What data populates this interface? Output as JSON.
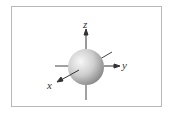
{
  "diagram": {
    "shape": "sphere",
    "axes": [
      {
        "name": "z",
        "label": "z"
      },
      {
        "name": "y",
        "label": "y"
      },
      {
        "name": "x",
        "label": "x"
      }
    ],
    "colors": {
      "border": "#b8b8b8",
      "axis": "#333333",
      "sphere_light": "#f4f4f4",
      "sphere_dark": "#8a8a8a"
    }
  }
}
